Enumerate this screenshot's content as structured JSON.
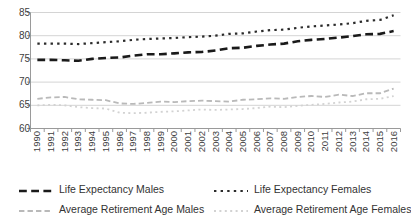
{
  "chart_data": {
    "type": "line",
    "title": "",
    "xlabel": "",
    "ylabel": "",
    "ylim": [
      60,
      85
    ],
    "yticks": [
      60,
      65,
      70,
      75,
      80,
      85
    ],
    "grid": true,
    "legend_position": "bottom",
    "x": [
      1990,
      1991,
      1992,
      1993,
      1994,
      1995,
      1996,
      1997,
      1998,
      1999,
      2000,
      2001,
      2002,
      2003,
      2004,
      2005,
      2006,
      2007,
      2008,
      2009,
      2010,
      2011,
      2012,
      2013,
      2014,
      2015,
      2016
    ],
    "series": [
      {
        "name": "Life Expectancy Males",
        "style": "dashed",
        "color": "#1a1a1a",
        "width": 2.6,
        "values": [
          74.8,
          74.8,
          74.7,
          74.6,
          75.0,
          75.2,
          75.3,
          75.7,
          76.0,
          76.0,
          76.2,
          76.4,
          76.5,
          76.8,
          77.3,
          77.4,
          77.8,
          78.1,
          78.3,
          78.8,
          79.1,
          79.3,
          79.6,
          79.9,
          80.3,
          80.4,
          81.0
        ]
      },
      {
        "name": "Life Expectancy Females",
        "style": "dotted",
        "color": "#2b2b2b",
        "width": 2.2,
        "values": [
          78.3,
          78.3,
          78.3,
          78.2,
          78.4,
          78.6,
          78.8,
          79.1,
          79.3,
          79.4,
          79.5,
          79.7,
          79.8,
          80.0,
          80.4,
          80.5,
          80.9,
          81.2,
          81.3,
          81.7,
          82.0,
          82.2,
          82.4,
          82.7,
          83.2,
          83.4,
          84.4
        ]
      },
      {
        "name": "Average Retirement Age Males",
        "style": "dashed",
        "color": "#b9b9b9",
        "width": 1.8,
        "values": [
          66.4,
          66.7,
          66.8,
          66.3,
          66.2,
          66.1,
          65.4,
          65.3,
          65.5,
          65.8,
          65.7,
          65.9,
          66.0,
          65.9,
          65.8,
          66.2,
          66.3,
          66.5,
          66.4,
          66.8,
          67.0,
          66.8,
          67.3,
          67.0,
          67.6,
          67.6,
          68.6
        ]
      },
      {
        "name": "Average Retirement Age Females",
        "style": "dotted",
        "color": "#d2d2d2",
        "width": 1.8,
        "values": [
          65.0,
          65.1,
          65.0,
          64.6,
          64.4,
          64.3,
          63.4,
          63.3,
          63.4,
          63.6,
          63.7,
          63.9,
          64.1,
          64.0,
          64.1,
          64.2,
          64.4,
          64.7,
          64.6,
          64.9,
          65.1,
          65.3,
          65.6,
          65.8,
          66.3,
          66.4,
          67.0
        ]
      }
    ]
  },
  "axis": {
    "ytick_labels": [
      "85",
      "80",
      "75",
      "70",
      "65",
      "60"
    ],
    "xtick_labels": [
      "1990",
      "1991",
      "1992",
      "1993",
      "1994",
      "1995",
      "1996",
      "1997",
      "1998",
      "1999",
      "2000",
      "2001",
      "2002",
      "2003",
      "2004",
      "2005",
      "2006",
      "2007",
      "2008",
      "2009",
      "2010",
      "2011",
      "2012",
      "2013",
      "2014",
      "2015",
      "2016"
    ]
  },
  "legend": {
    "items": [
      {
        "label": "Life Expectancy Males",
        "color": "#1a1a1a",
        "style": "dashed",
        "width": 2.6
      },
      {
        "label": "Life Expectancy Females",
        "color": "#2b2b2b",
        "style": "dotted",
        "width": 2.2
      },
      {
        "label": "Average Retirement Age Males",
        "color": "#b9b9b9",
        "style": "dashed",
        "width": 1.8
      },
      {
        "label": "Average Retirement Age Females",
        "color": "#d2d2d2",
        "style": "dotted",
        "width": 1.8
      }
    ]
  },
  "colors": {
    "gridline": "#d4d4d4",
    "axis": "#9a9a9a",
    "text": "#404040",
    "background": "#ffffff"
  }
}
